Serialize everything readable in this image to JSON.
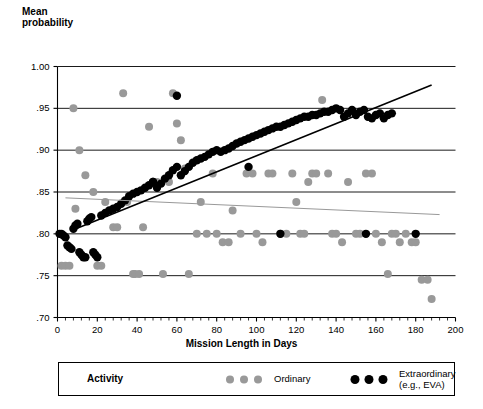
{
  "chart_data": {
    "type": "scatter",
    "title": "",
    "ylabel": "Mean\nprobability",
    "xlabel": "Mission Length in Days",
    "xlim": [
      0,
      200
    ],
    "ylim": [
      0.7,
      1.0
    ],
    "xticks": [
      0,
      20,
      40,
      60,
      80,
      100,
      120,
      140,
      160,
      180,
      200
    ],
    "xtick_labels": [
      "0",
      "20",
      "40",
      "60",
      "80",
      "100",
      "120",
      "140",
      "160",
      "180",
      "200"
    ],
    "yticks": [
      0.7,
      0.75,
      0.8,
      0.85,
      0.9,
      0.95,
      1.0
    ],
    "ytick_labels": [
      ".70",
      ".75",
      ".80",
      ".85",
      ".90",
      ".95",
      "1.00"
    ],
    "grid": "horizontal",
    "minor_xticks": true,
    "legend_position": "below",
    "legend_title": "Activity",
    "colors": {
      "ordinary": "#999999",
      "extraordinary": "#000000",
      "axis": "#000000",
      "gridline": "#000000"
    },
    "series": [
      {
        "name": "Ordinary",
        "legend_label": "Ordinary",
        "marker": "circle",
        "color": "#999999",
        "points": [
          [
            2,
            0.762
          ],
          [
            4,
            0.762
          ],
          [
            6,
            0.762
          ],
          [
            8,
            0.95
          ],
          [
            9,
            0.83
          ],
          [
            11,
            0.9
          ],
          [
            14,
            0.87
          ],
          [
            18,
            0.85
          ],
          [
            20,
            0.762
          ],
          [
            22,
            0.762
          ],
          [
            24,
            0.838
          ],
          [
            28,
            0.808
          ],
          [
            30,
            0.808
          ],
          [
            33,
            0.968
          ],
          [
            35,
            0.838
          ],
          [
            38,
            0.752
          ],
          [
            39,
            0.752
          ],
          [
            41,
            0.752
          ],
          [
            43,
            0.808
          ],
          [
            46,
            0.928
          ],
          [
            48,
            0.862
          ],
          [
            50,
            0.862
          ],
          [
            53,
            0.752
          ],
          [
            56,
            0.862
          ],
          [
            58,
            0.968
          ],
          [
            60,
            0.932
          ],
          [
            62,
            0.912
          ],
          [
            64,
            0.878
          ],
          [
            66,
            0.752
          ],
          [
            70,
            0.8
          ],
          [
            72,
            0.838
          ],
          [
            75,
            0.8
          ],
          [
            78,
            0.872
          ],
          [
            80,
            0.8
          ],
          [
            83,
            0.79
          ],
          [
            86,
            0.79
          ],
          [
            88,
            0.828
          ],
          [
            92,
            0.8
          ],
          [
            95,
            0.872
          ],
          [
            98,
            0.872
          ],
          [
            100,
            0.8
          ],
          [
            103,
            0.79
          ],
          [
            106,
            0.872
          ],
          [
            108,
            0.872
          ],
          [
            112,
            0.8
          ],
          [
            115,
            0.8
          ],
          [
            118,
            0.872
          ],
          [
            120,
            0.838
          ],
          [
            122,
            0.8
          ],
          [
            124,
            0.8
          ],
          [
            126,
            0.862
          ],
          [
            128,
            0.872
          ],
          [
            130,
            0.872
          ],
          [
            133,
            0.96
          ],
          [
            136,
            0.872
          ],
          [
            138,
            0.8
          ],
          [
            140,
            0.8
          ],
          [
            143,
            0.79
          ],
          [
            146,
            0.862
          ],
          [
            150,
            0.8
          ],
          [
            152,
            0.8
          ],
          [
            155,
            0.872
          ],
          [
            158,
            0.872
          ],
          [
            160,
            0.8
          ],
          [
            163,
            0.79
          ],
          [
            166,
            0.752
          ],
          [
            168,
            0.8
          ],
          [
            170,
            0.8
          ],
          [
            172,
            0.79
          ],
          [
            175,
            0.8
          ],
          [
            178,
            0.79
          ],
          [
            180,
            0.79
          ],
          [
            183,
            0.745
          ],
          [
            186,
            0.745
          ],
          [
            188,
            0.722
          ]
        ],
        "regression": {
          "x_start": 4,
          "y_start": 0.843,
          "x_end": 192,
          "y_end": 0.823
        }
      },
      {
        "name": "Extraordinary (e.g., EVA)",
        "legend_label": "Extraordinary\n(e.g., EVA)",
        "marker": "circle",
        "color": "#000000",
        "points": [
          [
            1,
            0.8
          ],
          [
            2,
            0.8
          ],
          [
            3,
            0.798
          ],
          [
            4,
            0.796
          ],
          [
            5,
            0.786
          ],
          [
            6,
            0.784
          ],
          [
            7,
            0.782
          ],
          [
            8,
            0.806
          ],
          [
            9,
            0.81
          ],
          [
            10,
            0.812
          ],
          [
            11,
            0.778
          ],
          [
            12,
            0.775
          ],
          [
            13,
            0.772
          ],
          [
            14,
            0.772
          ],
          [
            15,
            0.815
          ],
          [
            16,
            0.818
          ],
          [
            17,
            0.82
          ],
          [
            18,
            0.778
          ],
          [
            19,
            0.775
          ],
          [
            20,
            0.772
          ],
          [
            22,
            0.822
          ],
          [
            24,
            0.825
          ],
          [
            26,
            0.828
          ],
          [
            28,
            0.83
          ],
          [
            30,
            0.832
          ],
          [
            32,
            0.836
          ],
          [
            34,
            0.84
          ],
          [
            36,
            0.845
          ],
          [
            38,
            0.848
          ],
          [
            40,
            0.85
          ],
          [
            42,
            0.852
          ],
          [
            44,
            0.855
          ],
          [
            46,
            0.858
          ],
          [
            48,
            0.862
          ],
          [
            50,
            0.855
          ],
          [
            52,
            0.86
          ],
          [
            54,
            0.866
          ],
          [
            56,
            0.87
          ],
          [
            58,
            0.876
          ],
          [
            60,
            0.88
          ],
          [
            62,
            0.87
          ],
          [
            64,
            0.875
          ],
          [
            66,
            0.88
          ],
          [
            68,
            0.885
          ],
          [
            70,
            0.888
          ],
          [
            72,
            0.89
          ],
          [
            74,
            0.892
          ],
          [
            76,
            0.895
          ],
          [
            78,
            0.898
          ],
          [
            80,
            0.9
          ],
          [
            82,
            0.898
          ],
          [
            84,
            0.9
          ],
          [
            86,
            0.902
          ],
          [
            88,
            0.905
          ],
          [
            90,
            0.908
          ],
          [
            92,
            0.91
          ],
          [
            94,
            0.912
          ],
          [
            96,
            0.914
          ],
          [
            98,
            0.916
          ],
          [
            100,
            0.918
          ],
          [
            102,
            0.92
          ],
          [
            104,
            0.922
          ],
          [
            106,
            0.924
          ],
          [
            108,
            0.926
          ],
          [
            110,
            0.928
          ],
          [
            112,
            0.928
          ],
          [
            114,
            0.93
          ],
          [
            116,
            0.932
          ],
          [
            118,
            0.934
          ],
          [
            120,
            0.936
          ],
          [
            122,
            0.938
          ],
          [
            124,
            0.94
          ],
          [
            126,
            0.94
          ],
          [
            128,
            0.942
          ],
          [
            130,
            0.942
          ],
          [
            132,
            0.944
          ],
          [
            134,
            0.946
          ],
          [
            136,
            0.946
          ],
          [
            138,
            0.948
          ],
          [
            140,
            0.95
          ],
          [
            142,
            0.948
          ],
          [
            144,
            0.94
          ],
          [
            146,
            0.944
          ],
          [
            148,
            0.948
          ],
          [
            150,
            0.942
          ],
          [
            152,
            0.946
          ],
          [
            154,
            0.948
          ],
          [
            156,
            0.94
          ],
          [
            158,
            0.938
          ],
          [
            160,
            0.942
          ],
          [
            162,
            0.944
          ],
          [
            164,
            0.938
          ],
          [
            166,
            0.942
          ],
          [
            168,
            0.944
          ],
          [
            48,
            0.862
          ],
          [
            60,
            0.965
          ],
          [
            96,
            0.88
          ],
          [
            112,
            0.8
          ],
          [
            155,
            0.8
          ],
          [
            180,
            0.8
          ]
        ],
        "regression": {
          "x_start": 8,
          "y_start": 0.805,
          "x_end": 188,
          "y_end": 0.978
        }
      }
    ]
  }
}
